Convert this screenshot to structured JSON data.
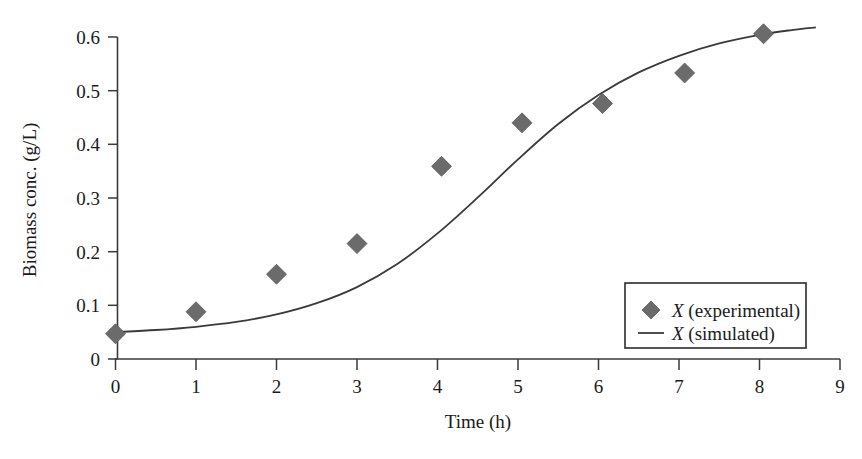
{
  "chart_data": {
    "type": "scatter",
    "title": "",
    "xlabel": "Time (h)",
    "ylabel": "Biomass conc. (g/L)",
    "xlim": [
      0,
      9
    ],
    "ylim": [
      0,
      0.6
    ],
    "xticks": [
      "0",
      "1",
      "2",
      "3",
      "4",
      "5",
      "6",
      "7",
      "8",
      "9"
    ],
    "xtick_values": [
      0,
      1,
      2,
      3,
      4,
      5,
      6,
      7,
      8,
      9
    ],
    "yticks": [
      "0",
      "0.1",
      "0.2",
      "0.3",
      "0.4",
      "0.5",
      "0.6"
    ],
    "ytick_values": [
      0,
      0.1,
      0.2,
      0.3,
      0.4,
      0.5,
      0.6
    ],
    "grid": false,
    "legend_position": "lower-right",
    "series": [
      {
        "name": "X (experimental)",
        "type": "scatter",
        "marker": "diamond",
        "color": "#6b6b6b",
        "x": [
          0.0,
          1.0,
          2.0,
          3.0,
          4.05,
          5.05,
          6.05,
          7.07,
          8.05
        ],
        "y": [
          0.047,
          0.088,
          0.158,
          0.215,
          0.359,
          0.44,
          0.476,
          0.533,
          0.606
        ]
      },
      {
        "name": "X (simulated)",
        "type": "line",
        "color": "#3a3a3a",
        "x": [
          0.0,
          0.5,
          1.0,
          1.5,
          2.0,
          2.5,
          3.0,
          3.5,
          4.0,
          4.5,
          5.0,
          5.5,
          6.0,
          6.5,
          7.0,
          7.5,
          8.0,
          8.4,
          8.7
        ],
        "y": [
          0.05,
          0.054,
          0.06,
          0.069,
          0.083,
          0.104,
          0.134,
          0.177,
          0.234,
          0.301,
          0.372,
          0.438,
          0.492,
          0.534,
          0.565,
          0.588,
          0.604,
          0.613,
          0.618
        ]
      }
    ]
  },
  "legend": {
    "entries": [
      {
        "symbol_name": "diamond-marker",
        "italic_label": "X",
        "rest_label": " (experimental)"
      },
      {
        "symbol_name": "line-marker",
        "italic_label": "X",
        "rest_label": " (simulated)"
      }
    ]
  },
  "axes": {
    "x_title": "Time (h)",
    "y_title": "Biomass conc. (g/L)"
  }
}
